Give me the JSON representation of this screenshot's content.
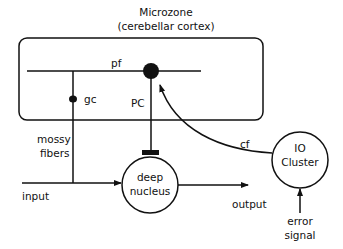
{
  "title": {
    "line1": "Microzone",
    "line2": "(cerebellar cortex)"
  },
  "labels": {
    "pf": "pf",
    "gc": "gc",
    "pc": "PC",
    "mossy1": "mossy",
    "mossy2": "fibers",
    "cf": "cf",
    "input": "input",
    "output": "output",
    "deep1": "deep",
    "deep2": "nucleus",
    "io1": "IO",
    "io2": "Cluster",
    "err1": "error",
    "err2": "signal"
  },
  "colors": {
    "stroke": "#111111",
    "background": "#ffffff"
  }
}
